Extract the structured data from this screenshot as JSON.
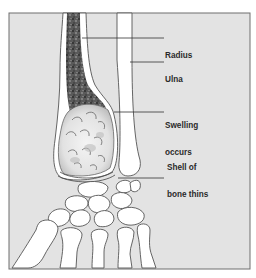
{
  "figure": {
    "background_color": "#e3e3e3",
    "bone_fill_color": "#ffffff",
    "outline_color": "#555555",
    "frame_color": "#6e6e6e"
  },
  "labels": [
    {
      "id": "radius",
      "lines": [
        "Radius"
      ]
    },
    {
      "id": "ulna",
      "lines": [
        "Ulna"
      ]
    },
    {
      "id": "swelling",
      "lines": [
        "Swelling",
        "occurs"
      ]
    },
    {
      "id": "shell",
      "lines": [
        "Shell of",
        "bone thins"
      ]
    }
  ]
}
